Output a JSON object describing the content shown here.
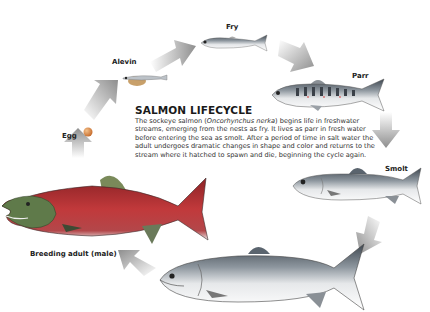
{
  "title": "SALMON LIFECYCLE",
  "description": {
    "before_species": "The sockeye salmon (",
    "species": "Oncorhynchus nerka",
    "after_species": ") begins life in freshwater streams, emerging from the nests as fry. It lives as parr in fresh water before entering the sea as smolt. After a period of time in salt water the adult undergoes dramatic changes in shape and color and returns to the stream where it hatched to spawn and die, beginning the cycle again."
  },
  "stages": {
    "egg": "Egg",
    "alevin": "Alevin",
    "fry": "Fry",
    "parr": "Parr",
    "smolt": "Smolt",
    "ocean_adult": "",
    "breeding_adult": "Breeding adult (male)"
  },
  "colors": {
    "arrow": "#9a9a9a",
    "breeding_body": "#b8383a",
    "breeding_head": "#5f7a4a",
    "silver": "#c9ccd0",
    "back": "#55606a",
    "egg": "#d9823a"
  }
}
